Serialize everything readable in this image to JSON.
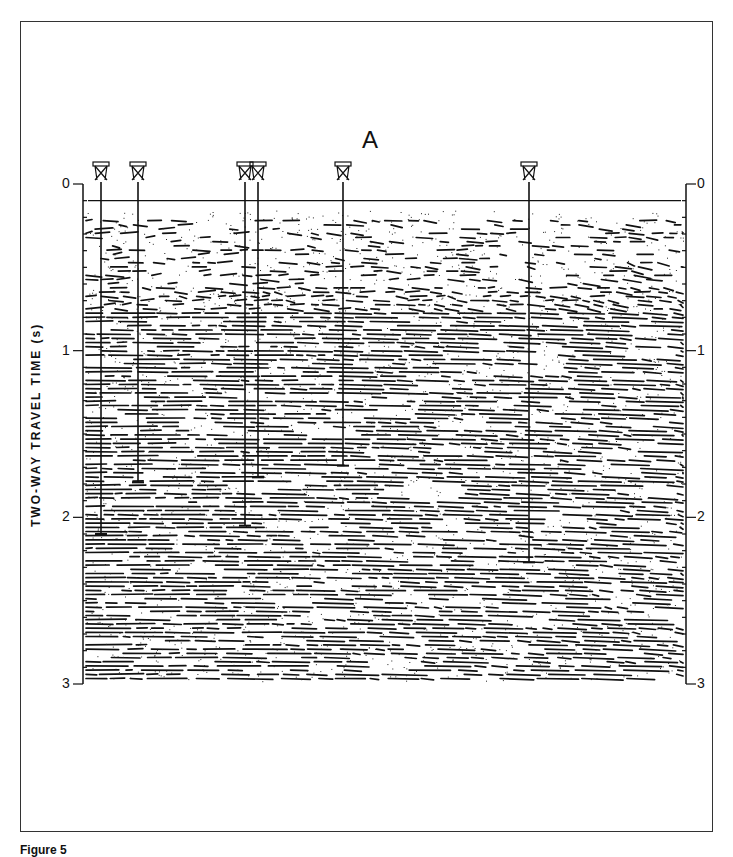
{
  "figure": {
    "panel_label": "A",
    "y_axis_title": "TWO-WAY TRAVEL TIME (s)",
    "y_ticks": [
      "0",
      "1",
      "2",
      "3"
    ],
    "caption_partial": "Figure 5",
    "section_labels": [
      "Holocene",
      "Holocene",
      "Holocene",
      "Pliocene",
      "Miocene",
      "Cretaceous"
    ]
  },
  "wells": [
    {
      "name": "well-1",
      "x": 101,
      "td_time": 2.1
    },
    {
      "name": "well-2",
      "x": 138,
      "td_time": 1.79
    },
    {
      "name": "well-3",
      "x": 245,
      "td_time": 2.05
    },
    {
      "name": "well-4",
      "x": 258,
      "td_time": 1.76
    },
    {
      "name": "well-5",
      "x": 343,
      "td_time": 1.69
    },
    {
      "name": "well-6",
      "x": 529,
      "td_time": 2.27
    }
  ],
  "colors": {
    "ink": "#111111",
    "paper": "#ffffff"
  }
}
